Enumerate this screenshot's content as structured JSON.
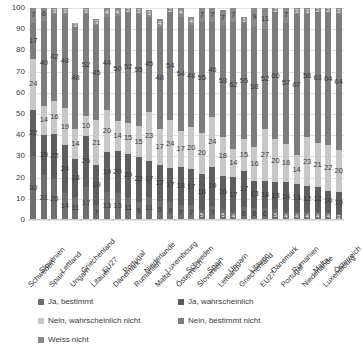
{
  "chart_data": {
    "type": "bar",
    "subtype": "stacked-column-100",
    "title": "",
    "xlabel": "",
    "ylabel": "",
    "ylim": [
      0,
      100
    ],
    "y_ticks": [
      0,
      10,
      20,
      30,
      40,
      50,
      60,
      70,
      80,
      90,
      100
    ],
    "grid": true,
    "legend_position": "bottom",
    "categories": [
      "Schweden",
      "Slovenien",
      "Spain",
      "Lettland",
      "Ungarn",
      "Griechenland",
      "Litauen",
      "EU27",
      "Dänemark",
      "Portugal",
      "Rumänien",
      "Niederlande",
      "Malta",
      "Luxembourg",
      "Österreich",
      "Schweden",
      "Slovenien",
      "Spain",
      "Lettland",
      "Ungarn",
      "Griechenland",
      "Litauen",
      "EU27",
      "Dänemark",
      "Portugal",
      "Rumänien",
      "Niederlande",
      "Malta",
      "Luxembourg",
      "Österreich"
    ],
    "series": [
      {
        "name": "Ja, bestimmt",
        "color": "#6f6f6f",
        "values": [
          30,
          21,
          20,
          14,
          11,
          17,
          7,
          13,
          13,
          11,
          9,
          11,
          9,
          9,
          7,
          7,
          5,
          7,
          5,
          4,
          6,
          6,
          6,
          5,
          4,
          4,
          4,
          4,
          4,
          3
        ]
      },
      {
        "name": "Ja, wahrscheinlich",
        "color": "#5e5e5e",
        "values": [
          22,
          19,
          22,
          24,
          18,
          26,
          19,
          19,
          20,
          20,
          22,
          17,
          17,
          17,
          18,
          17,
          18,
          19,
          16,
          17,
          17,
          13,
          14,
          13,
          14,
          13,
          12,
          12,
          10,
          10
        ]
      },
      {
        "name": "Nein, wahrscheinlich nicht",
        "color": "#c7c7c7",
        "values": [
          24,
          14,
          16,
          19,
          14,
          10,
          21,
          20,
          14,
          15,
          15,
          23,
          17,
          24,
          17,
          20,
          20,
          24,
          18,
          14,
          15,
          16,
          27,
          20,
          18,
          14,
          23,
          21,
          22,
          20
        ]
      },
      {
        "name": "Nein, bestimmt nicht",
        "color": "#7d7d7d",
        "values": [
          17,
          40,
          42,
          48,
          48,
          52,
          45,
          44,
          50,
          52,
          55,
          45,
          48,
          54,
          54,
          48,
          55,
          46,
          53,
          62,
          55,
          58,
          52,
          60,
          57,
          67,
          58,
          63,
          64,
          64
        ]
      },
      {
        "name": "Weiss nicht",
        "color": "#8a8a8a",
        "values": [
          7,
          6,
          3,
          3,
          2,
          3,
          3,
          4,
          4,
          2,
          3,
          3,
          4,
          2,
          4,
          4,
          7,
          7,
          7,
          7,
          3,
          9,
          11,
          2,
          7,
          3,
          3,
          2,
          2,
          3
        ]
      }
    ]
  },
  "legend": {
    "entries": [
      {
        "label": "Ja, bestimmt"
      },
      {
        "label": "Ja, wahrscheinlich"
      },
      {
        "label": "Nein, wahrscheinlich nicht"
      },
      {
        "label": "Nein, bestimmt nicht"
      },
      {
        "label": "Weiss nicht"
      }
    ]
  }
}
